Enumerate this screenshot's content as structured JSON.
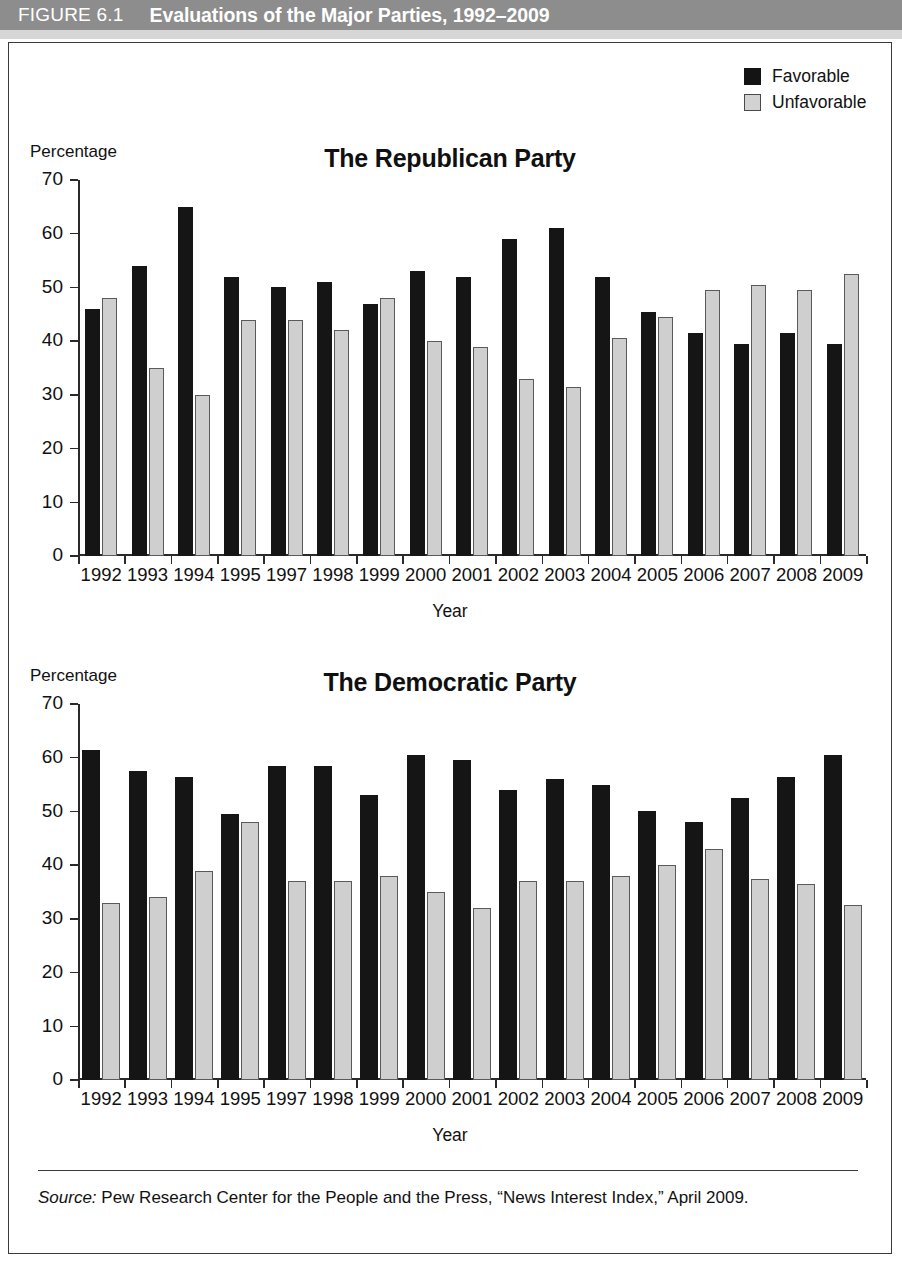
{
  "header": {
    "figure_number": "FIGURE 6.1",
    "title": "Evaluations of the Major Parties, 1992–2009",
    "band_color": "#8d8d8d"
  },
  "legend": {
    "position": "top-right",
    "items": [
      {
        "label": "Favorable",
        "color": "#151515",
        "icon": "filled-square-icon"
      },
      {
        "label": "Unfavorable",
        "color": "#cfcfcf",
        "icon": "outlined-square-icon"
      }
    ]
  },
  "source": {
    "label": "Source:",
    "text": " Pew Research Center for the People and the Press, “News Interest Index,” April 2009."
  },
  "chart_data": [
    {
      "id": "republican",
      "type": "bar",
      "title": "The Republican Party",
      "xlabel": "Year",
      "ylabel": "Percentage",
      "ylim": [
        0,
        70
      ],
      "yticks": [
        0,
        10,
        20,
        30,
        40,
        50,
        60,
        70
      ],
      "grid": false,
      "legend_position": "figure-top-right",
      "categories": [
        "1992",
        "1993",
        "1994",
        "1995",
        "1997",
        "1998",
        "1999",
        "2000",
        "2001",
        "2002",
        "2003",
        "2004",
        "2005",
        "2006",
        "2007",
        "2008",
        "2009"
      ],
      "series": [
        {
          "name": "Favorable",
          "color": "#151515",
          "values": [
            46.0,
            54.0,
            65.0,
            52.0,
            50.0,
            51.0,
            47.0,
            53.0,
            52.0,
            59.0,
            61.0,
            52.0,
            45.5,
            41.5,
            39.5,
            41.5,
            39.5
          ]
        },
        {
          "name": "Unfavorable",
          "color": "#cfcfcf",
          "values": [
            48.0,
            35.0,
            30.0,
            44.0,
            44.0,
            42.0,
            48.0,
            40.0,
            39.0,
            33.0,
            31.5,
            40.5,
            44.5,
            49.5,
            50.5,
            49.5,
            52.5
          ]
        }
      ]
    },
    {
      "id": "democratic",
      "type": "bar",
      "title": "The Democratic Party",
      "xlabel": "Year",
      "ylabel": "Percentage",
      "ylim": [
        0,
        70
      ],
      "yticks": [
        0,
        10,
        20,
        30,
        40,
        50,
        60,
        70
      ],
      "grid": false,
      "legend_position": "figure-top-right",
      "categories": [
        "1992",
        "1993",
        "1994",
        "1995",
        "1997",
        "1998",
        "1999",
        "2000",
        "2001",
        "2002",
        "2003",
        "2004",
        "2005",
        "2006",
        "2007",
        "2008",
        "2009"
      ],
      "series": [
        {
          "name": "Favorable",
          "color": "#151515",
          "values": [
            61.5,
            57.5,
            56.5,
            49.5,
            58.5,
            58.5,
            53.0,
            60.5,
            59.5,
            54.0,
            56.0,
            55.0,
            50.0,
            48.0,
            52.5,
            56.5,
            60.5
          ]
        },
        {
          "name": "Unfavorable",
          "color": "#cfcfcf",
          "values": [
            33.0,
            34.0,
            39.0,
            48.0,
            37.0,
            37.0,
            38.0,
            35.0,
            32.0,
            37.0,
            37.0,
            38.0,
            40.0,
            43.0,
            37.5,
            36.5,
            32.5
          ]
        }
      ]
    }
  ]
}
